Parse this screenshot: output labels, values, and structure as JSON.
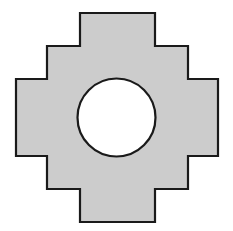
{
  "figure": {
    "name": "stepped-cruciform-plate",
    "title": "Stepped cruciform plate with central circular hole",
    "canvas": {
      "width": 233,
      "height": 231,
      "background_color": "#ffffff"
    },
    "colors": {
      "plate_fill": "#cccccc",
      "plate_stroke": "#1a1a1a",
      "hole_fill": "#ffffff",
      "hole_stroke": "#1a1a1a",
      "background": "#ffffff"
    },
    "stroke_width": 2.2
  },
  "shape": {
    "type": "polygon-with-circular-hole",
    "description": "Four-fold symmetric stepped cross (plus sign with notched, stepped corners) containing one centered circular hole.",
    "symmetry": "4-fold (horizontal and vertical mirror)",
    "outline_label": "stepped-cruciform-outline",
    "bounds": {
      "left": 16,
      "right": 218,
      "top": 13,
      "bottom": 222,
      "width": 202,
      "height": 209
    },
    "key_coordinates": {
      "arm_left_x": 80,
      "arm_right_x": 155,
      "step_left_x": 47,
      "step_right_x": 188,
      "outer_left_x": 16,
      "outer_right_x": 218,
      "arm_top_y": 13,
      "arm_bottom_y": 222,
      "step_top_y": 46,
      "step_bottom_y": 189,
      "band_top_y": 79,
      "band_bottom_y": 156
    },
    "polygon_points": "80,13 155,13 155,46 188,46 188,79 218,79 218,156 188,156 188,189 155,189 155,222 80,222 80,189 47,189 47,156 16,156 16,79 47,79 47,46 80,46",
    "vertex_count": 20,
    "step_count_per_corner": 2
  },
  "hole": {
    "name": "central-circular-hole",
    "type": "circle",
    "center_x": 116.5,
    "center_y": 117.5,
    "radius": 39,
    "diameter": 78,
    "fill": "#ffffff",
    "stroke": "#1a1a1a"
  },
  "labels": {
    "has_text": false,
    "has_dimensions": false,
    "has_axes": false,
    "has_legend": false
  }
}
